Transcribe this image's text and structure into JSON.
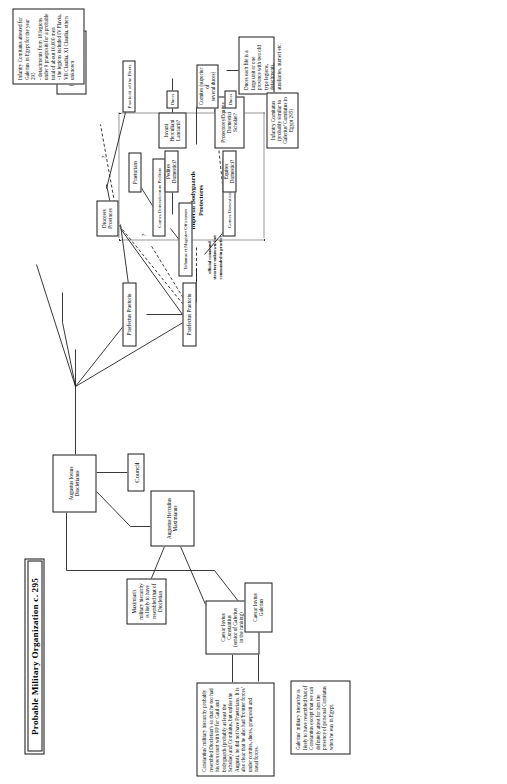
{
  "document": {
    "title": "Probable Military Organization c. 295",
    "orientation": "landscape-chart-rotated-90-on-portrait-page"
  },
  "nodes": {
    "augustus_diocletianus": "Augustus Iovius\nDiocletianus",
    "council": "Council",
    "augustus_maximianus": "Augustus Herculius\nMaximianus",
    "caesar_constantius": "Caesar Iovius\nConstantius\n(senior of Galerius\nin the ranking)",
    "caesar_galerius": "Caesar Iovius\nGalerius",
    "praefectus_praetorio_1": "Praefectus Praetorio",
    "praefectus_praetorio_2": "Praefectus Praetorio",
    "tribunus_magister_officiorum": "Tribunus et Magister Officiorum",
    "dioceses_provinces": "Dioceses\nProvinces",
    "comes_domesticorum_peditum": "Comes Domesticorum Peditum",
    "comes_domesticorum_equitum": "Comes Domesticorum Equitum",
    "praetorians": "Praetorians",
    "pedites_domestici": "Pedites Domestici?",
    "equites_domestici": "Equites Domestici?",
    "iovani_herculiani": "Iovani\nHerculiani\nLanciarii?",
    "protectores_scholae": "Protectores/Equites Domestici\nScholae?",
    "duces_1": "Duces",
    "duces_2": "Duces",
    "comites": "Comites (superior of\nseveral duces)",
    "praefecti_fleets": "Praefecti of the Fleets",
    "federate_auxiliaries": "Federate Auxiliaries\n(Germans, Sarmatians,\nBerbers, Arabs etc.)"
  },
  "group": {
    "label": "Imperial Bodyguards\nProtectores"
  },
  "annotations": {
    "command_structure": "official command\nstructure unknown, but\ncommanded in practice",
    "question_mark": "?"
  },
  "notes": {
    "galerius_note": "Galerius' military hierarchy is likely to have resembled that of Constantius except that we can definitely attest for him the presence of personal Comitatus when he was in Egypt.",
    "maximian_note": "Maximian's military hierarchy is likely to have resembled that of Diocletian",
    "constantius_note": "Constantius' military hierarchy probably resembled Diocletian's so that he too had his own court with PP for Gaul and bodyguards (probably at least the Scholae) and Comitatus, but unlike the Augusti, he did not have Praetorians. It is also clear that he also had 'frontier forces' under comites, duces, praepositi and naval forces.",
    "galerius_comitatus_note": "Infantry Comitatus attested for Galerius in Egypt for the year 295\n- detachments from 18 legions under 9 praepositi for a probable total of about 10,000 men\n- the legions included IV Flavia, VII Claudia, XI Claudia, others unknown",
    "infantry_comitatus_small": "Infantry Comitatus\n(probably similar to\nGalerius' Comitatus in\nEgypt 295)",
    "duces_note": "Duces each file is a large unit or one province with two old type legions, detachments, auxiliaries, numeri etc."
  },
  "colors": {
    "ink": "#151515",
    "paper": "#ffffff",
    "group_border": "#333333"
  }
}
